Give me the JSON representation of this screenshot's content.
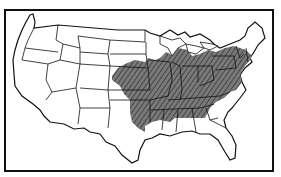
{
  "figure": {
    "type": "map",
    "style": "black-and-white line drawing",
    "frame": {
      "stroke": "#111111",
      "background": "#ffffff"
    },
    "shaded_region": {
      "description": "Hatched/shaded region covering the eastern-central United States",
      "fill": "#6e6e6e",
      "hatch": "#2a2a2a",
      "approx_extent": "From eastern Kansas/Nebraska and Oklahoma east to the Atlantic seaboard states, north to southern Great Lakes and southern New England, south to northern Gulf states"
    },
    "unshaded_areas": [
      "Western states",
      "Northern Great Plains",
      "Upper Great Lakes",
      "Northern New England",
      "Florida",
      "Gulf coast",
      "Texas"
    ],
    "colors": {
      "line": "#1a1a1a",
      "land": "#ffffff",
      "shade": "#6e6e6e"
    }
  }
}
